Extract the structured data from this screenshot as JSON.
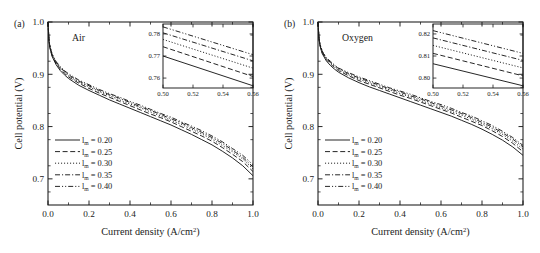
{
  "figure": {
    "panels": [
      {
        "id": "a",
        "panel_label": "(a)",
        "gas_label": "Air",
        "inset_yticks": [
          "0.76",
          "0.77",
          "0.78"
        ],
        "inset_xticks": [
          "0.50",
          "0.52",
          "0.54",
          "0.56"
        ]
      },
      {
        "id": "b",
        "panel_label": "(b)",
        "gas_label": "Oxygen",
        "inset_yticks": [
          "0.80",
          "0.81",
          "0.82"
        ],
        "inset_xticks": [
          "0.50",
          "0.52",
          "0.54",
          "0.56"
        ]
      }
    ],
    "axis": {
      "xlabel_main": "Current density (A/cm",
      "xlabel_sup": "2",
      "xlabel_tail": ")",
      "ylabel": "Cell potential (V)",
      "xticks": [
        "0.0",
        "0.2",
        "0.4",
        "0.6",
        "0.8",
        "1.0"
      ],
      "yticks": [
        "0.7",
        "0.8",
        "0.9",
        "1.0"
      ]
    },
    "legend": {
      "symbol": "l",
      "subscript": "m",
      "values": [
        "= 0.20",
        "= 0.25",
        "= 0.30",
        "= 0.35",
        "= 0.40"
      ],
      "styles": [
        "solid",
        "dashed",
        "dotted",
        "dashdot",
        "dashdotdot"
      ]
    },
    "colors": {
      "ink": "#1a1a1a",
      "background": "#ffffff"
    }
  },
  "chart_data": {
    "type": "line",
    "title": "",
    "xlabel": "Current density (A/cm2)",
    "ylabel": "Cell potential (V)",
    "xlim": [
      0.0,
      1.0
    ],
    "ylim": [
      0.65,
      1.0
    ],
    "grid": false,
    "legend_position": "center-left",
    "panels": [
      {
        "id": "a",
        "name": "Air",
        "x": [
          0.0,
          0.005,
          0.01,
          0.02,
          0.04,
          0.06,
          0.08,
          0.1,
          0.15,
          0.2,
          0.25,
          0.3,
          0.35,
          0.4,
          0.45,
          0.5,
          0.55,
          0.6,
          0.65,
          0.7,
          0.75,
          0.8,
          0.85,
          0.9,
          0.95,
          1.0
        ],
        "series": [
          {
            "name": "lm = 0.20",
            "style": "solid",
            "values": [
              1.0,
              0.962,
              0.949,
              0.934,
              0.918,
              0.907,
              0.899,
              0.892,
              0.879,
              0.869,
              0.86,
              0.851,
              0.843,
              0.835,
              0.827,
              0.819,
              0.811,
              0.803,
              0.794,
              0.785,
              0.775,
              0.765,
              0.753,
              0.74,
              0.725,
              0.706
            ]
          },
          {
            "name": "lm = 0.25",
            "style": "dashed",
            "values": [
              1.0,
              0.963,
              0.95,
              0.936,
              0.92,
              0.91,
              0.902,
              0.895,
              0.883,
              0.873,
              0.864,
              0.856,
              0.848,
              0.84,
              0.832,
              0.824,
              0.817,
              0.809,
              0.8,
              0.791,
              0.782,
              0.772,
              0.76,
              0.747,
              0.733,
              0.714
            ]
          },
          {
            "name": "lm = 0.30",
            "style": "dotted",
            "values": [
              1.0,
              0.964,
              0.951,
              0.937,
              0.922,
              0.912,
              0.904,
              0.897,
              0.885,
              0.876,
              0.867,
              0.859,
              0.851,
              0.843,
              0.836,
              0.828,
              0.82,
              0.812,
              0.804,
              0.795,
              0.786,
              0.776,
              0.764,
              0.752,
              0.738,
              0.719
            ]
          },
          {
            "name": "lm = 0.35",
            "style": "dashdot",
            "values": [
              1.0,
              0.964,
              0.952,
              0.938,
              0.923,
              0.913,
              0.906,
              0.899,
              0.887,
              0.878,
              0.869,
              0.861,
              0.854,
              0.846,
              0.838,
              0.831,
              0.823,
              0.815,
              0.807,
              0.798,
              0.789,
              0.779,
              0.768,
              0.755,
              0.741,
              0.723
            ]
          },
          {
            "name": "lm = 0.40",
            "style": "dashdotdot",
            "values": [
              1.0,
              0.965,
              0.953,
              0.939,
              0.924,
              0.915,
              0.907,
              0.901,
              0.889,
              0.88,
              0.871,
              0.863,
              0.856,
              0.848,
              0.841,
              0.833,
              0.825,
              0.818,
              0.809,
              0.801,
              0.792,
              0.782,
              0.771,
              0.758,
              0.745,
              0.727
            ]
          }
        ],
        "inset": {
          "xlim": [
            0.5,
            0.56
          ],
          "ylim": [
            0.7555,
            0.7845
          ],
          "xticks": [
            0.5,
            0.52,
            0.54,
            0.56
          ],
          "yticks": [
            0.76,
            0.77,
            0.78
          ],
          "series": [
            {
              "name": "lm = 0.20",
              "style": "solid",
              "y_at_0.50": 0.77,
              "y_at_0.56": 0.7565
            },
            {
              "name": "lm = 0.25",
              "style": "dashed",
              "y_at_0.50": 0.7742,
              "y_at_0.56": 0.7607
            },
            {
              "name": "lm = 0.30",
              "style": "dotted",
              "y_at_0.50": 0.7775,
              "y_at_0.56": 0.7645
            },
            {
              "name": "lm = 0.35",
              "style": "dashdot",
              "y_at_0.50": 0.7805,
              "y_at_0.56": 0.7678
            },
            {
              "name": "lm = 0.40",
              "style": "dashdotdot",
              "y_at_0.50": 0.7832,
              "y_at_0.56": 0.7706
            }
          ]
        }
      },
      {
        "id": "b",
        "name": "Oxygen",
        "x": [
          0.0,
          0.005,
          0.01,
          0.02,
          0.04,
          0.06,
          0.08,
          0.1,
          0.15,
          0.2,
          0.25,
          0.3,
          0.35,
          0.4,
          0.45,
          0.5,
          0.55,
          0.6,
          0.65,
          0.7,
          0.75,
          0.8,
          0.85,
          0.9,
          0.95,
          1.0
        ],
        "series": [
          {
            "name": "lm = 0.20",
            "style": "solid",
            "values": [
              1.0,
              0.966,
              0.954,
              0.94,
              0.926,
              0.917,
              0.91,
              0.904,
              0.893,
              0.884,
              0.876,
              0.869,
              0.862,
              0.855,
              0.848,
              0.841,
              0.834,
              0.827,
              0.82,
              0.812,
              0.804,
              0.795,
              0.785,
              0.774,
              0.761,
              0.745
            ]
          },
          {
            "name": "lm = 0.25",
            "style": "dashed",
            "values": [
              1.0,
              0.967,
              0.955,
              0.942,
              0.928,
              0.92,
              0.913,
              0.907,
              0.897,
              0.888,
              0.881,
              0.874,
              0.867,
              0.86,
              0.854,
              0.847,
              0.84,
              0.833,
              0.826,
              0.818,
              0.81,
              0.802,
              0.792,
              0.781,
              0.768,
              0.752
            ]
          },
          {
            "name": "lm = 0.30",
            "style": "dotted",
            "values": [
              1.0,
              0.968,
              0.956,
              0.943,
              0.93,
              0.922,
              0.915,
              0.909,
              0.899,
              0.891,
              0.883,
              0.876,
              0.87,
              0.863,
              0.857,
              0.85,
              0.843,
              0.836,
              0.829,
              0.822,
              0.814,
              0.805,
              0.796,
              0.785,
              0.772,
              0.757
            ]
          },
          {
            "name": "lm = 0.35",
            "style": "dashdot",
            "values": [
              1.0,
              0.968,
              0.957,
              0.944,
              0.931,
              0.923,
              0.917,
              0.911,
              0.901,
              0.893,
              0.886,
              0.879,
              0.872,
              0.866,
              0.859,
              0.853,
              0.846,
              0.839,
              0.832,
              0.825,
              0.817,
              0.808,
              0.799,
              0.788,
              0.776,
              0.761
            ]
          },
          {
            "name": "lm = 0.40",
            "style": "dashdotdot",
            "values": [
              1.0,
              0.969,
              0.958,
              0.945,
              0.932,
              0.925,
              0.918,
              0.912,
              0.903,
              0.895,
              0.888,
              0.881,
              0.874,
              0.868,
              0.862,
              0.855,
              0.848,
              0.842,
              0.835,
              0.827,
              0.82,
              0.811,
              0.802,
              0.791,
              0.779,
              0.764
            ]
          }
        ],
        "inset": {
          "xlim": [
            0.5,
            0.56
          ],
          "ylim": [
            0.7955,
            0.8245
          ],
          "xticks": [
            0.5,
            0.52,
            0.54,
            0.56
          ],
          "yticks": [
            0.8,
            0.81,
            0.82
          ],
          "series": [
            {
              "name": "lm = 0.20",
              "style": "solid",
              "y_at_0.50": 0.8065,
              "y_at_0.56": 0.7965
            },
            {
              "name": "lm = 0.25",
              "style": "dashed",
              "y_at_0.50": 0.8112,
              "y_at_0.56": 0.801
            },
            {
              "name": "lm = 0.30",
              "style": "dotted",
              "y_at_0.50": 0.8148,
              "y_at_0.56": 0.8046
            },
            {
              "name": "lm = 0.35",
              "style": "dashdot",
              "y_at_0.50": 0.8182,
              "y_at_0.56": 0.808
            },
            {
              "name": "lm = 0.40",
              "style": "dashdotdot",
              "y_at_0.50": 0.8215,
              "y_at_0.56": 0.8112
            }
          ]
        }
      }
    ]
  }
}
